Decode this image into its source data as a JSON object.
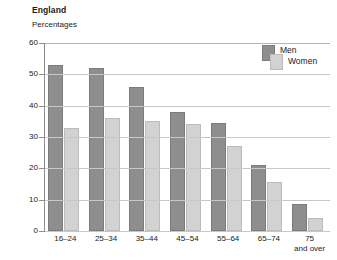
{
  "header": {
    "title": "England",
    "subtitle": "Percentages"
  },
  "legend": {
    "men_label": "Men",
    "women_label": "Women"
  },
  "colors": {
    "men": "#8e8e8e",
    "women": "#d2d2d2",
    "gridline": "#c8c8c8",
    "axis": "#8c8c8c",
    "text": "#1a1a1a",
    "background": "#ffffff"
  },
  "chart_data": {
    "type": "bar",
    "title": "England",
    "subtitle": "Percentages",
    "xlabel": "",
    "ylabel": "Percentages",
    "ylim": [
      0,
      60
    ],
    "yticks": [
      0,
      10,
      20,
      30,
      40,
      50,
      60
    ],
    "grid": true,
    "legend_position": "top-right",
    "categories": [
      "16–24",
      "25–34",
      "35–44",
      "45–54",
      "55–64",
      "65–74",
      "75 and over"
    ],
    "category_lines": [
      [
        "16–24"
      ],
      [
        "25–34"
      ],
      [
        "35–44"
      ],
      [
        "45–54"
      ],
      [
        "55–64"
      ],
      [
        "65–74"
      ],
      [
        "75",
        "and over"
      ]
    ],
    "series": [
      {
        "name": "Men",
        "values": [
          53,
          52,
          46,
          38,
          34.5,
          21,
          8.5
        ]
      },
      {
        "name": "Women",
        "values": [
          33,
          36,
          35,
          34,
          27,
          15.5,
          4
        ]
      }
    ]
  }
}
